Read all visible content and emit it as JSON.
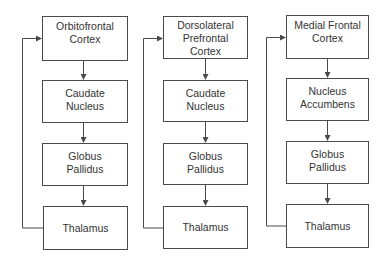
{
  "diagram": {
    "type": "flowchart",
    "colors": {
      "line": "#4a4a4a",
      "text": "#333333",
      "background": "#ffffff"
    },
    "circuits": [
      {
        "id": "orbitofrontal",
        "nodes": [
          "Orbitofrontal\nCortex",
          "Caudate\nNucleus",
          "Globus\nPallidus",
          "Thalamus"
        ],
        "feedback": "Thalamus → Orbitofrontal Cortex"
      },
      {
        "id": "dorsolateral-prefrontal",
        "nodes": [
          "Dorsolateral\nPrefrontal\nCortex",
          "Caudate\nNucleus",
          "Globus\nPallidus",
          "Thalamus"
        ],
        "feedback": "Thalamus → Dorsolateral Prefrontal Cortex"
      },
      {
        "id": "medial-frontal",
        "nodes": [
          "Medial Frontal\nCortex",
          "Nucleus\nAccumbens",
          "Globus\nPallidus",
          "Thalamus"
        ],
        "feedback": "Thalamus → Medial Frontal Cortex"
      }
    ]
  }
}
